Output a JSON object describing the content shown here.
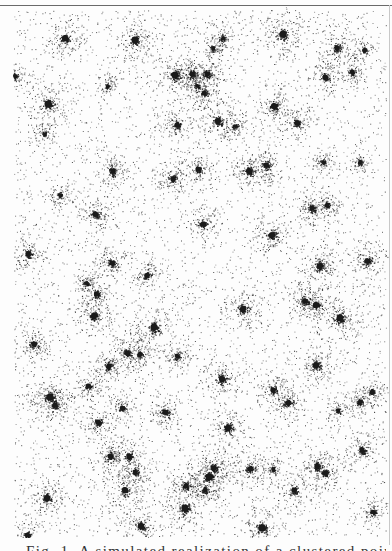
{
  "figure": {
    "ink_color": "#1a1a1a",
    "background_color": "#fdfdfd",
    "rule_color": "#6a6a6a",
    "background_points": 5200,
    "clusters": [
      [
        65,
        38,
        14
      ],
      [
        135,
        40,
        16
      ],
      [
        213,
        48,
        8
      ],
      [
        223,
        38,
        8
      ],
      [
        283,
        34,
        16
      ],
      [
        337,
        48,
        12
      ],
      [
        364,
        50,
        8
      ],
      [
        15,
        76,
        8
      ],
      [
        48,
        104,
        16
      ],
      [
        108,
        86,
        8
      ],
      [
        175,
        75,
        16
      ],
      [
        192,
        74,
        12
      ],
      [
        207,
        74,
        12
      ],
      [
        197,
        86,
        8
      ],
      [
        204,
        93,
        10
      ],
      [
        325,
        77,
        12
      ],
      [
        352,
        72,
        10
      ],
      [
        44,
        134,
        8
      ],
      [
        177,
        125,
        12
      ],
      [
        218,
        121,
        14
      ],
      [
        274,
        106,
        14
      ],
      [
        297,
        123,
        12
      ],
      [
        235,
        126,
        8
      ],
      [
        113,
        171,
        12
      ],
      [
        173,
        179,
        12
      ],
      [
        198,
        169,
        12
      ],
      [
        249,
        171,
        14
      ],
      [
        266,
        165,
        12
      ],
      [
        323,
        162,
        8
      ],
      [
        360,
        162,
        8
      ],
      [
        60,
        195,
        8
      ],
      [
        95,
        214,
        12
      ],
      [
        203,
        224,
        12
      ],
      [
        272,
        235,
        14
      ],
      [
        312,
        208,
        12
      ],
      [
        327,
        205,
        10
      ],
      [
        28,
        254,
        12
      ],
      [
        112,
        263,
        12
      ],
      [
        147,
        275,
        10
      ],
      [
        320,
        266,
        14
      ],
      [
        367,
        261,
        12
      ],
      [
        86,
        283,
        8
      ],
      [
        96,
        294,
        10
      ],
      [
        243,
        309,
        14
      ],
      [
        94,
        316,
        14
      ],
      [
        154,
        327,
        16
      ],
      [
        305,
        301,
        12
      ],
      [
        316,
        305,
        14
      ],
      [
        340,
        318,
        16
      ],
      [
        34,
        344,
        12
      ],
      [
        127,
        353,
        12
      ],
      [
        140,
        354,
        10
      ],
      [
        177,
        356,
        10
      ],
      [
        109,
        366,
        12
      ],
      [
        222,
        379,
        14
      ],
      [
        316,
        365,
        14
      ],
      [
        88,
        386,
        10
      ],
      [
        273,
        390,
        12
      ],
      [
        50,
        397,
        16
      ],
      [
        55,
        405,
        12
      ],
      [
        288,
        403,
        12
      ],
      [
        122,
        408,
        10
      ],
      [
        165,
        412,
        12
      ],
      [
        372,
        392,
        10
      ],
      [
        98,
        422,
        12
      ],
      [
        338,
        410,
        8
      ],
      [
        228,
        428,
        14
      ],
      [
        360,
        402,
        10
      ],
      [
        129,
        456,
        12
      ],
      [
        110,
        456,
        12
      ],
      [
        135,
        472,
        10
      ],
      [
        186,
        486,
        12
      ],
      [
        209,
        477,
        16
      ],
      [
        214,
        468,
        12
      ],
      [
        205,
        490,
        10
      ],
      [
        250,
        469,
        12
      ],
      [
        273,
        469,
        8
      ],
      [
        317,
        466,
        12
      ],
      [
        325,
        473,
        12
      ],
      [
        362,
        450,
        12
      ],
      [
        47,
        498,
        14
      ],
      [
        125,
        490,
        14
      ],
      [
        185,
        508,
        16
      ],
      [
        141,
        526,
        14
      ],
      [
        294,
        490,
        12
      ],
      [
        262,
        528,
        16
      ],
      [
        373,
        512,
        10
      ],
      [
        27,
        535,
        10
      ]
    ]
  },
  "caption": {
    "text_truncated": "Fig. 1. A simulated realization of a clustered point process"
  }
}
